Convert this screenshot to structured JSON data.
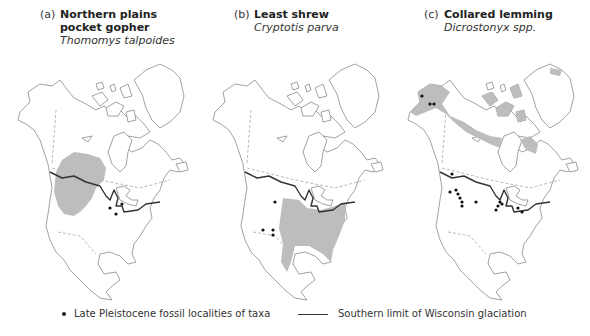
{
  "panels": [
    {
      "letter": "(a)",
      "common_name": "Northern plains pocket gopher",
      "scientific_name": "Thomomys talpoides",
      "range_region": "Northern Great Plains and northern Rocky Mountains",
      "fossil_localities_count": 3
    },
    {
      "letter": "(b)",
      "common_name": "Least shrew",
      "scientific_name": "Cryptotis parva",
      "range_region": "Eastern and central United States into eastern Mexico",
      "fossil_localities_count": 4
    },
    {
      "letter": "(c)",
      "common_name": "Collared lemming",
      "scientific_name": "Dicrostonyx spp.",
      "range_region": "Arctic Alaska, northern Canada, Arctic islands and Greenland coast",
      "fossil_localities_count": 17
    }
  ],
  "legend": {
    "fossil_label": "Late Pleistocene fossil localities of taxa",
    "glaciation_label": "Southern limit of Wisconsin glaciation"
  },
  "colors": {
    "range_fill": "#bdbdbd",
    "glaciation_line": "#333333",
    "coastline": "#8a8a8a"
  }
}
